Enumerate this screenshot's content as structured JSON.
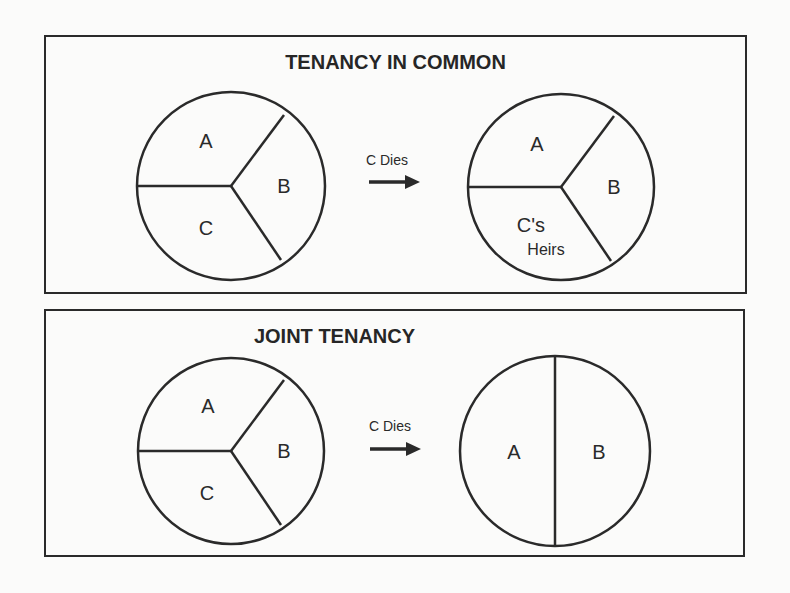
{
  "panels": [
    {
      "title": "TENANCY IN COMMON",
      "before": {
        "segments": [
          "A",
          "B",
          "C"
        ]
      },
      "event": {
        "label": "C Dies",
        "icon": "right-arrow-icon"
      },
      "after": {
        "segments": [
          "A",
          "B",
          "C's",
          "Heirs"
        ],
        "segment_labels": [
          "A",
          "B",
          "C's Heirs"
        ]
      }
    },
    {
      "title": "JOINT TENANCY",
      "before": {
        "segments": [
          "A",
          "B",
          "C"
        ]
      },
      "event": {
        "label": "C Dies",
        "icon": "right-arrow-icon"
      },
      "after": {
        "segments": [
          "A",
          "B"
        ]
      }
    }
  ],
  "colors": {
    "line": "#2a2a2a",
    "background": "#fbfbfa"
  }
}
